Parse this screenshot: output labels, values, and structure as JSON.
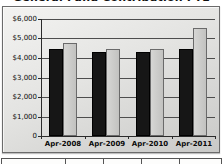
{
  "title": {
    "text": "General Fund Contribution FTE",
    "note": "title is clipped at top edge of screenshot; only bottom sliver of bold text visible"
  },
  "chart_data": {
    "type": "bar",
    "categories": [
      "Apr-2008",
      "Apr-2009",
      "Apr-2010",
      "Apr-2011"
    ],
    "series": [
      {
        "name": "dark-bar-series",
        "color": "#161616",
        "values": [
          4450,
          4300,
          4300,
          4450
        ]
      },
      {
        "name": "light-bar-series",
        "color": "#c9c9c7",
        "values": [
          4750,
          4450,
          4450,
          5550
        ]
      }
    ],
    "xlabel": "",
    "ylabel": "",
    "ylim": [
      0,
      6000
    ],
    "y_tick_values": [
      6000,
      5000,
      4000,
      3000,
      2000,
      1000,
      0
    ],
    "y_tick_labels": [
      "$6,000",
      "$5,000",
      "$4,000",
      "$3,000",
      "$2,000",
      "$1,000",
      "0"
    ],
    "grid": true,
    "legend_position": "none"
  },
  "colors": {
    "bar_dark": "#161616",
    "bar_light": "#c9c9c7",
    "bar_light_border": "#6a6a6a",
    "gridline": "#4d4d4d",
    "frame_border": "#6b6b6b",
    "plot_bg_top": "#f3f3f1",
    "plot_bg_bottom": "#c9c9c7"
  },
  "bottom_table": {
    "note": "table clipped at bottom edge; only top border and column dividers visible, no text",
    "cells": [
      "",
      "",
      "",
      "",
      ""
    ]
  }
}
